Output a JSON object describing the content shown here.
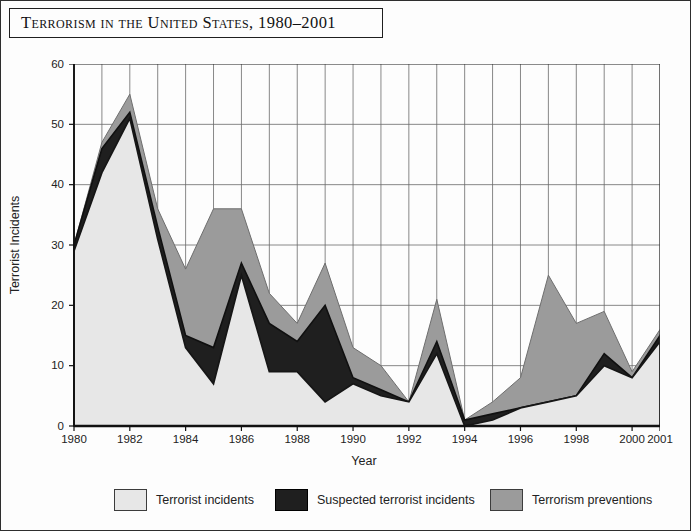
{
  "figure": {
    "title": "Terrorism in the United States, 1980–2001",
    "background": "#fdfdfd",
    "frame_color": "#2e2e2e"
  },
  "chart_data": {
    "type": "area",
    "stacked": true,
    "title": "Terrorism in the United States, 1980–2001",
    "xlabel": "Year",
    "ylabel": "Terrorist Incidents",
    "ylim": [
      0,
      60
    ],
    "xlim": [
      1980,
      2001
    ],
    "y_ticks": [
      0,
      10,
      20,
      30,
      40,
      50,
      60
    ],
    "x_tick_labels": [
      "1980",
      "1982",
      "1984",
      "1986",
      "1988",
      "1990",
      "1992",
      "1994",
      "1996",
      "1998",
      "2000",
      "2001"
    ],
    "grid": "vertical line at every year; horizontal line every 10 units",
    "legend_position": "bottom",
    "years": [
      1980,
      1981,
      1982,
      1983,
      1984,
      1985,
      1986,
      1987,
      1988,
      1989,
      1990,
      1991,
      1992,
      1993,
      1994,
      1995,
      1996,
      1997,
      1998,
      1999,
      2000,
      2001
    ],
    "series": [
      {
        "name": "Terrorist incidents",
        "color": "#e7e7e7",
        "edge_color": "#161616",
        "values": [
          29,
          42,
          51,
          31,
          13,
          7,
          25,
          9,
          9,
          4,
          7,
          5,
          4,
          12,
          0,
          1,
          3,
          4,
          5,
          10,
          8,
          14
        ]
      },
      {
        "name": "Suspected terrorist incidents",
        "color": "#1f1f1f",
        "edge_color": "#101010",
        "values": [
          1,
          4,
          1,
          2,
          2,
          6,
          2,
          8,
          5,
          16,
          1,
          1,
          0,
          2,
          1,
          1,
          0,
          0,
          0,
          2,
          0,
          1
        ]
      },
      {
        "name": "Terrorism preventions",
        "color": "#9b9b9b",
        "edge_color": "#6e6e6e",
        "values": [
          0,
          1,
          3,
          3,
          11,
          23,
          9,
          5,
          3,
          7,
          5,
          4,
          0,
          7,
          0,
          2,
          5,
          21,
          12,
          7,
          1,
          1
        ]
      }
    ],
    "stacked_totals": [
      30,
      47,
      55,
      36,
      26,
      36,
      36,
      22,
      17,
      27,
      13,
      10,
      4,
      21,
      1,
      4,
      8,
      25,
      17,
      19,
      9,
      16
    ],
    "grid_color": "#6a6a6a",
    "axis_color": "#111111"
  },
  "legend": {
    "items": [
      {
        "label": "Terrorist incidents",
        "color": "#e7e7e7"
      },
      {
        "label": "Suspected terrorist incidents",
        "color": "#1f1f1f"
      },
      {
        "label": "Terrorism preventions",
        "color": "#9b9b9b"
      }
    ]
  }
}
